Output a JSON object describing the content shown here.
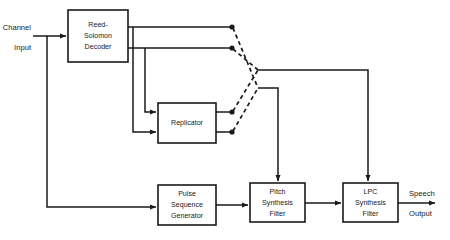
{
  "diagram": {
    "type": "block-diagram",
    "stroke_color": "#1a1a1a",
    "background_color": "#ffffff",
    "blocks": [
      {
        "id": "reed-solomon-decoder",
        "lines": [
          "Reed-",
          "Solomon",
          "Decoder"
        ],
        "x": 68,
        "y": 10,
        "w": 60,
        "h": 52
      },
      {
        "id": "replicator",
        "lines": [
          "Replicator"
        ],
        "x": 158,
        "y": 103,
        "w": 58,
        "h": 40
      },
      {
        "id": "pulse-sequence-generator",
        "lines": [
          "Pulse",
          "Sequence",
          "Generator"
        ],
        "x": 158,
        "y": 185,
        "w": 58,
        "h": 40
      },
      {
        "id": "pitch-synthesis-filter",
        "lines": [
          "Pitch",
          "Synthesis",
          "Filter"
        ],
        "x": 250,
        "y": 183,
        "w": 55,
        "h": 39
      },
      {
        "id": "lpc-synthesis-filter",
        "lines": [
          "LPC",
          "Synthesis",
          "Filter"
        ],
        "x": 343,
        "y": 183,
        "w": 55,
        "h": 39
      }
    ],
    "labels": {
      "channel": "Channel",
      "input": "Input",
      "speech": "Speech",
      "output": "Output"
    },
    "switch": {
      "name": "crossed-selector-switch",
      "contacts": [
        {
          "id": "contact-decoder-upper",
          "x": 232,
          "y": 27
        },
        {
          "id": "contact-decoder-lower",
          "x": 232,
          "y": 48
        },
        {
          "id": "contact-replicator-upper",
          "x": 232,
          "y": 112
        },
        {
          "id": "contact-replicator-lower",
          "x": 232,
          "y": 132
        }
      ],
      "poles": [
        {
          "id": "pole-upper-to-lpc",
          "x": 258,
          "y": 70
        },
        {
          "id": "pole-lower-to-pitch",
          "x": 258,
          "y": 88
        }
      ]
    }
  }
}
